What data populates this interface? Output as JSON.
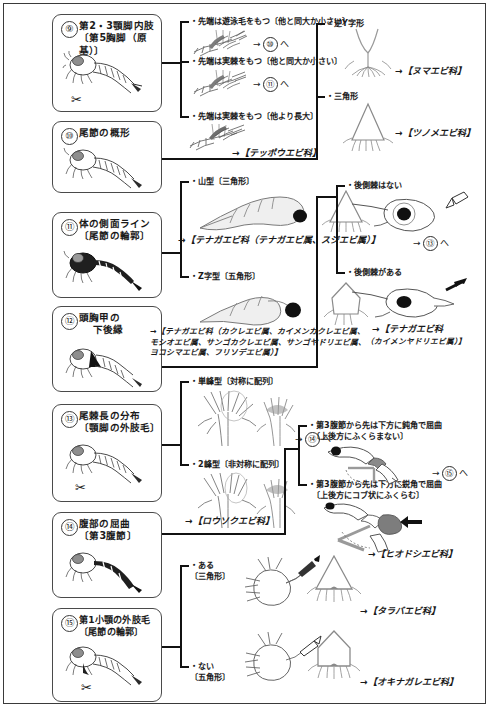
{
  "document": {
    "kind": "identification-key",
    "subject": "shrimp larvae dichotomous key (Japanese)",
    "page_range": "steps 9-15"
  },
  "steps": [
    {
      "id": "9",
      "num": "⑨",
      "title": "第2・3顎脚内肢",
      "sub": "〔第5胸脚（原基）〕",
      "has_scissors": true
    },
    {
      "id": "10",
      "num": "⑩",
      "title": "尾節の概形",
      "sub": "",
      "has_scissors": false
    },
    {
      "id": "11",
      "num": "⑪",
      "title": "体の側面ライン",
      "sub": "〔尾節の輪郭〕",
      "has_scissors": false
    },
    {
      "id": "12",
      "num": "⑫",
      "title": "頭胸甲の",
      "sub": "下後縁",
      "has_scissors": false
    },
    {
      "id": "13",
      "num": "⑬",
      "title": "尾棘長の分布",
      "sub": "〔顎脚の外肢毛〕",
      "has_scissors": true
    },
    {
      "id": "14",
      "num": "⑭",
      "title": "腹部の屈曲",
      "sub": "〔第3腹節〕",
      "has_scissors": false
    },
    {
      "id": "15",
      "num": "⑮",
      "title": "第1小顎の外肢毛",
      "sub": "〔尾節の輪郭〕",
      "has_scissors": true
    }
  ],
  "branches": {
    "b9_1": "・先端は遊泳毛をもつ〔他と同大か小さい〕",
    "b9_2": "・先端は実棘をもつ〔他と同大か小さい〕",
    "b9_3": "・先端は実棘をもつ〔他より長大〕",
    "b10_1": "・逆Y字形",
    "b10_2": "・三角形",
    "b11_1": "・山型〔三角形〕",
    "b11_2": "・Z字型〔五角形〕",
    "b12_1": "・後側棘はない",
    "b12_2": "・後側棘がある",
    "b13_1": "・単峰型〔対称に配列〕",
    "b13_2": "・2峰型〔非対称に配列〕",
    "b14_1_l1": "・第3腹節から先は下方に鈍角で屈曲",
    "b14_1_l2": "〔上後方にふくらまない〕",
    "b14_2_l1": "・第3腹節から先は下方に鋭角で屈曲",
    "b14_2_l2": "〔上後方にコブ状にふくらむ〕",
    "b15_1_l1": "・ある",
    "b15_1_l2": "〔三角形〕",
    "b15_2_l1": "・ない",
    "b15_2_l2": "〔五角形〕"
  },
  "gotos": {
    "g_to_10": {
      "arrow": "→",
      "num": "⑩",
      "suffix": "へ"
    },
    "g_to_11": {
      "arrow": "→",
      "num": "⑪",
      "suffix": "へ"
    },
    "g_to_13": {
      "arrow": "→",
      "num": "⑬",
      "suffix": "へ"
    },
    "g_to_14": {
      "arrow": "→",
      "num": "⑭",
      "suffix": "へ"
    },
    "g_to_15": {
      "arrow": "→",
      "num": "⑮",
      "suffix": "へ"
    }
  },
  "results": {
    "teppou": "→【テッポウエビ科】",
    "numa": "→【ヌマエビ科】",
    "tsunome": "→【ツノメエビ科】",
    "tenaga_1": "→【テナガエビ科（テナガエビ属、スジエビ属）】",
    "tenaga_2_l1": "→【テナガエビ科（カクレエビ属、カイメンカクレエビ属、",
    "tenaga_2_l2": "モシオエビ属、サンゴカクレエビ属、サンゴヤドリエビ属、",
    "tenaga_2_l3": "ヨコシマエビ属、フリソデエビ属）】",
    "tenaga_3_l1": "→【テナガエビ科",
    "tenaga_3_l2": "（カイメンヤドリエビ属）】",
    "rousoku": "→【ロウソクエビ科】",
    "hiodoshi": "→【ヒオドシエビ科】",
    "taraba": "→【タラバエビ科】",
    "okinagare": "→【オキナガレエビ科】"
  },
  "icons": {
    "scissors": "✂",
    "arrow_right": "→"
  },
  "colors": {
    "ink": "#1a1a1a",
    "line": "#111111",
    "box_border": "#4a4a4a",
    "art_stroke": "#555555",
    "art_light": "#9a9a9a",
    "art_fill_dark": "#2b2b2b",
    "art_fill_mid": "#7d7d7d",
    "paper": "#ffffff"
  }
}
